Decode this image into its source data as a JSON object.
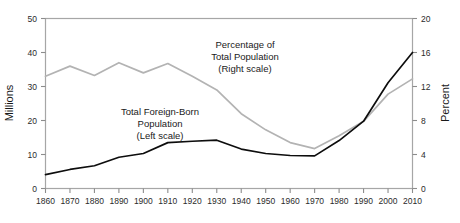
{
  "chart_data": {
    "type": "line",
    "title": "",
    "xlabel": "",
    "x": [
      1860,
      1870,
      1880,
      1890,
      1900,
      1910,
      1920,
      1930,
      1940,
      1950,
      1960,
      1970,
      1980,
      1990,
      2000,
      2010
    ],
    "xticklabels": [
      "1860",
      "1870",
      "1880",
      "1890",
      "1900",
      "1910",
      "1920",
      "1930",
      "1940",
      "1950",
      "1960",
      "1970",
      "1980",
      "1990",
      "2000",
      "2010"
    ],
    "xlim": [
      1860,
      2010
    ],
    "grid": false,
    "legend_position": "inline-annotations",
    "left_axis": {
      "label": "Millions",
      "ylim": [
        0,
        50
      ],
      "ticks": [
        0,
        10,
        20,
        30,
        40,
        50
      ],
      "ticklabels": [
        "0",
        "10",
        "20",
        "30",
        "40",
        "50"
      ]
    },
    "right_axis": {
      "label": "Percent",
      "ylim": [
        0,
        20
      ],
      "ticks": [
        0,
        4,
        8,
        12,
        16,
        20
      ],
      "ticklabels": [
        "0",
        "4",
        "8",
        "12",
        "16",
        "20"
      ]
    },
    "series": [
      {
        "name": "Total Foreign-Born Population",
        "axis": "left",
        "units": "Millions",
        "color": "#0d0d0d",
        "values": [
          4.1,
          5.6,
          6.7,
          9.2,
          10.3,
          13.5,
          13.9,
          14.2,
          11.6,
          10.3,
          9.7,
          9.6,
          14.1,
          19.8,
          31.1,
          40.0
        ]
      },
      {
        "name": "Percentage of Total Population",
        "axis": "right",
        "units": "Percent",
        "color": "#b3b3b3",
        "values": [
          13.2,
          14.4,
          13.3,
          14.8,
          13.6,
          14.7,
          13.2,
          11.6,
          8.8,
          6.9,
          5.4,
          4.7,
          6.2,
          7.9,
          11.1,
          12.9
        ]
      }
    ],
    "annotations": [
      {
        "name": "percentage-annotation",
        "lines": [
          "Percentage of",
          "Total Population",
          "(Right scale)"
        ]
      },
      {
        "name": "foreign-born-annotation",
        "lines": [
          "Total Foreign-Born",
          "Population",
          "(Left scale)"
        ]
      }
    ]
  }
}
